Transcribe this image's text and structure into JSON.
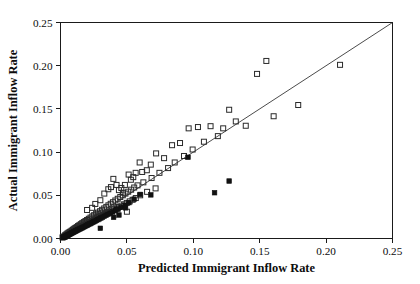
{
  "figure": {
    "background": "#ffffff",
    "frame_color": "#1a1a1a",
    "marker_open_name": "open-square",
    "marker_filled_name": "filled-square"
  },
  "chart_data": {
    "type": "scatter",
    "title": "",
    "xlabel": "Predicted Immigrant Inflow Rate",
    "ylabel": "Actual Immigrant Inflow Rate",
    "xlim": [
      0.0,
      0.25
    ],
    "ylim": [
      0.0,
      0.25
    ],
    "xticks": [
      0.0,
      0.05,
      0.1,
      0.15,
      0.2,
      0.25
    ],
    "yticks": [
      0.0,
      0.05,
      0.1,
      0.15,
      0.2,
      0.25
    ],
    "xtick_labels": [
      "0.00",
      "0.05",
      "0.10",
      "0.15",
      "0.20",
      "0.25"
    ],
    "ytick_labels": [
      "0.00",
      "0.05",
      "0.10",
      "0.15",
      "0.20",
      "0.25"
    ],
    "grid": false,
    "legend": null,
    "reference_line": {
      "name": "forty-five-degree-line",
      "from": [
        0.0,
        0.0
      ],
      "to": [
        0.25,
        0.25
      ],
      "description": "45 degree identity line"
    },
    "series": [
      {
        "name": "open-square-observations",
        "marker": "open-square",
        "points": [
          [
            0.0015,
            0.0012
          ],
          [
            0.0022,
            0.0018
          ],
          [
            0.0028,
            0.0024
          ],
          [
            0.0031,
            0.002
          ],
          [
            0.0035,
            0.0038
          ],
          [
            0.004,
            0.003
          ],
          [
            0.0044,
            0.0048
          ],
          [
            0.0048,
            0.004
          ],
          [
            0.0052,
            0.0058
          ],
          [
            0.0056,
            0.0046
          ],
          [
            0.006,
            0.0066
          ],
          [
            0.0063,
            0.0054
          ],
          [
            0.0068,
            0.0074
          ],
          [
            0.0072,
            0.0062
          ],
          [
            0.0076,
            0.0082
          ],
          [
            0.008,
            0.007
          ],
          [
            0.0085,
            0.0092
          ],
          [
            0.009,
            0.0078
          ],
          [
            0.0094,
            0.0102
          ],
          [
            0.0098,
            0.0086
          ],
          [
            0.0103,
            0.0112
          ],
          [
            0.0108,
            0.0094
          ],
          [
            0.0112,
            0.0122
          ],
          [
            0.0117,
            0.0104
          ],
          [
            0.0122,
            0.0132
          ],
          [
            0.0127,
            0.0112
          ],
          [
            0.0132,
            0.0144
          ],
          [
            0.0137,
            0.012
          ],
          [
            0.0142,
            0.0154
          ],
          [
            0.0148,
            0.013
          ],
          [
            0.0153,
            0.0166
          ],
          [
            0.0158,
            0.0138
          ],
          [
            0.0164,
            0.0178
          ],
          [
            0.017,
            0.0148
          ],
          [
            0.0176,
            0.019
          ],
          [
            0.0182,
            0.0158
          ],
          [
            0.0188,
            0.0202
          ],
          [
            0.0194,
            0.0168
          ],
          [
            0.02,
            0.0214
          ],
          [
            0.0206,
            0.0178
          ],
          [
            0.0213,
            0.0228
          ],
          [
            0.0219,
            0.019
          ],
          [
            0.0226,
            0.0242
          ],
          [
            0.0232,
            0.02
          ],
          [
            0.0239,
            0.0256
          ],
          [
            0.0246,
            0.0212
          ],
          [
            0.02,
            0.033
          ],
          [
            0.0238,
            0.0355
          ],
          [
            0.0253,
            0.027
          ],
          [
            0.026,
            0.0224
          ],
          [
            0.0268,
            0.0286
          ],
          [
            0.0275,
            0.0236
          ],
          [
            0.0282,
            0.03
          ],
          [
            0.029,
            0.0248
          ],
          [
            0.0262,
            0.04
          ],
          [
            0.0298,
            0.0316
          ],
          [
            0.0305,
            0.026
          ],
          [
            0.0313,
            0.0332
          ],
          [
            0.0321,
            0.0272
          ],
          [
            0.0329,
            0.0348
          ],
          [
            0.03,
            0.0443
          ],
          [
            0.0336,
            0.0284
          ],
          [
            0.0345,
            0.0366
          ],
          [
            0.0353,
            0.0296
          ],
          [
            0.033,
            0.052
          ],
          [
            0.0361,
            0.0384
          ],
          [
            0.037,
            0.0308
          ],
          [
            0.0378,
            0.0402
          ],
          [
            0.036,
            0.057
          ],
          [
            0.0387,
            0.0322
          ],
          [
            0.0395,
            0.042
          ],
          [
            0.0404,
            0.0336
          ],
          [
            0.038,
            0.0595
          ],
          [
            0.0413,
            0.044
          ],
          [
            0.0422,
            0.035
          ],
          [
            0.0431,
            0.046
          ],
          [
            0.0398,
            0.069
          ],
          [
            0.044,
            0.0365
          ],
          [
            0.045,
            0.048
          ],
          [
            0.0459,
            0.038
          ],
          [
            0.0422,
            0.062
          ],
          [
            0.0469,
            0.05
          ],
          [
            0.0479,
            0.0396
          ],
          [
            0.044,
            0.056
          ],
          [
            0.0489,
            0.052
          ],
          [
            0.0499,
            0.0412
          ],
          [
            0.0458,
            0.0585
          ],
          [
            0.051,
            0.0542
          ],
          [
            0.047,
            0.053
          ],
          [
            0.0521,
            0.043
          ],
          [
            0.0485,
            0.062
          ],
          [
            0.0532,
            0.0565
          ],
          [
            0.05,
            0.031
          ],
          [
            0.0543,
            0.0448
          ],
          [
            0.0513,
            0.074
          ],
          [
            0.0555,
            0.059
          ],
          [
            0.053,
            0.068
          ],
          [
            0.0567,
            0.0468
          ],
          [
            0.0548,
            0.071
          ],
          [
            0.058,
            0.0615
          ],
          [
            0.0566,
            0.076
          ],
          [
            0.06,
            0.05
          ],
          [
            0.0596,
            0.088
          ],
          [
            0.0624,
            0.065
          ],
          [
            0.0615,
            0.077
          ],
          [
            0.0652,
            0.054
          ],
          [
            0.065,
            0.079
          ],
          [
            0.0686,
            0.07
          ],
          [
            0.068,
            0.0855
          ],
          [
            0.0716,
            0.058
          ],
          [
            0.072,
            0.0985
          ],
          [
            0.0745,
            0.076
          ],
          [
            0.078,
            0.093
          ],
          [
            0.081,
            0.0815
          ],
          [
            0.084,
            0.108
          ],
          [
            0.086,
            0.088
          ],
          [
            0.09,
            0.1105
          ],
          [
            0.093,
            0.0955
          ],
          [
            0.0965,
            0.1275
          ],
          [
            0.0995,
            0.103
          ],
          [
            0.1035,
            0.129
          ],
          [
            0.108,
            0.112
          ],
          [
            0.113,
            0.13
          ],
          [
            0.1185,
            0.1185
          ],
          [
            0.1225,
            0.1275
          ],
          [
            0.127,
            0.149
          ],
          [
            0.132,
            0.1355
          ],
          [
            0.1395,
            0.1305
          ],
          [
            0.148,
            0.1905
          ],
          [
            0.155,
            0.2055
          ],
          [
            0.1605,
            0.1415
          ],
          [
            0.179,
            0.1545
          ],
          [
            0.2105,
            0.201
          ]
        ]
      },
      {
        "name": "filled-square-observations",
        "marker": "filled-square",
        "points": [
          [
            0.0018,
            0.001
          ],
          [
            0.0026,
            0.0016
          ],
          [
            0.0033,
            0.0022
          ],
          [
            0.0041,
            0.0028
          ],
          [
            0.0048,
            0.0034
          ],
          [
            0.0056,
            0.004
          ],
          [
            0.0063,
            0.0046
          ],
          [
            0.0071,
            0.0052
          ],
          [
            0.0078,
            0.0058
          ],
          [
            0.0086,
            0.0064
          ],
          [
            0.0093,
            0.007
          ],
          [
            0.0101,
            0.0076
          ],
          [
            0.0108,
            0.0082
          ],
          [
            0.0116,
            0.0088
          ],
          [
            0.0124,
            0.0094
          ],
          [
            0.0131,
            0.01
          ],
          [
            0.0139,
            0.0106
          ],
          [
            0.0147,
            0.0112
          ],
          [
            0.0155,
            0.0118
          ],
          [
            0.0163,
            0.0124
          ],
          [
            0.0171,
            0.013
          ],
          [
            0.0179,
            0.0137
          ],
          [
            0.0187,
            0.0143
          ],
          [
            0.0196,
            0.015
          ],
          [
            0.0204,
            0.0157
          ],
          [
            0.0213,
            0.0164
          ],
          [
            0.0222,
            0.0171
          ],
          [
            0.0231,
            0.0178
          ],
          [
            0.024,
            0.0185
          ],
          [
            0.025,
            0.0193
          ],
          [
            0.026,
            0.0201
          ],
          [
            0.027,
            0.0209
          ],
          [
            0.0281,
            0.0218
          ],
          [
            0.0292,
            0.0227
          ],
          [
            0.0304,
            0.0237
          ],
          [
            0.0316,
            0.0246
          ],
          [
            0.0329,
            0.0257
          ],
          [
            0.0343,
            0.0268
          ],
          [
            0.0358,
            0.028
          ],
          [
            0.0374,
            0.0293
          ],
          [
            0.03,
            0.0118
          ],
          [
            0.0392,
            0.0307
          ],
          [
            0.0412,
            0.0322
          ],
          [
            0.0434,
            0.034
          ],
          [
            0.04,
            0.0245
          ],
          [
            0.0458,
            0.036
          ],
          [
            0.042,
            0.034
          ],
          [
            0.0485,
            0.0385
          ],
          [
            0.044,
            0.0272
          ],
          [
            0.049,
            0.0355
          ],
          [
            0.0515,
            0.0415
          ],
          [
            0.0555,
            0.0455
          ],
          [
            0.06,
            0.051
          ],
          [
            0.068,
            0.0505
          ],
          [
            0.096,
            0.094
          ],
          [
            0.116,
            0.053
          ],
          [
            0.127,
            0.0665
          ]
        ]
      }
    ]
  }
}
